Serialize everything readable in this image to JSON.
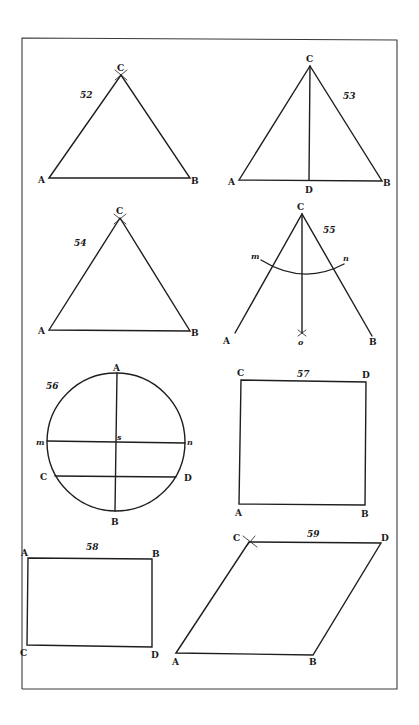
{
  "plate": {
    "figures": [
      {
        "id": "fig-52",
        "number": "52",
        "shape": "equilateral triangle",
        "labels": {
          "A": "A",
          "B": "B",
          "C": "C"
        }
      },
      {
        "id": "fig-53",
        "number": "53",
        "shape": "isosceles triangle with altitude CD",
        "labels": {
          "A": "A",
          "B": "B",
          "C": "C",
          "D": "D"
        }
      },
      {
        "id": "fig-54",
        "number": "54",
        "shape": "equilateral triangle",
        "labels": {
          "A": "A",
          "B": "B",
          "C": "C"
        }
      },
      {
        "id": "fig-55",
        "number": "55",
        "shape": "angle bisection with arc mn",
        "labels": {
          "A": "A",
          "B": "B",
          "C": "C",
          "m": "m",
          "n": "n",
          "o": "o"
        }
      },
      {
        "id": "fig-56",
        "number": "56",
        "shape": "circle with diameters and chord",
        "labels": {
          "A": "A",
          "B": "B",
          "C": "C",
          "D": "D",
          "m": "m",
          "n": "n",
          "s": "s"
        }
      },
      {
        "id": "fig-57",
        "number": "57",
        "shape": "square",
        "labels": {
          "A": "A",
          "B": "B",
          "C": "C",
          "D": "D"
        }
      },
      {
        "id": "fig-58",
        "number": "58",
        "shape": "rectangle",
        "labels": {
          "A": "A",
          "B": "B",
          "C": "C",
          "D": "D"
        }
      },
      {
        "id": "fig-59",
        "number": "59",
        "shape": "rhombus",
        "labels": {
          "A": "A",
          "B": "B",
          "C": "C",
          "D": "D"
        }
      }
    ]
  }
}
